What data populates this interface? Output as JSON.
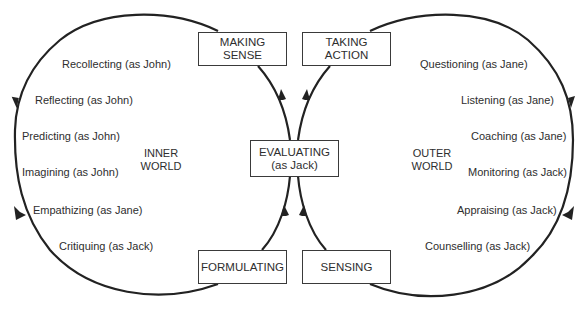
{
  "diagram": {
    "type": "figure-eight cycle",
    "boxes": {
      "making_sense": {
        "line1": "MAKING",
        "line2": "SENSE"
      },
      "taking_action": {
        "line1": "TAKING",
        "line2": "ACTION"
      },
      "evaluating": {
        "line1": "EVALUATING",
        "line2": "(as Jack)"
      },
      "formulating": {
        "line1": "FORMULATING"
      },
      "sensing": {
        "line1": "SENSING"
      }
    },
    "inner_world": {
      "line1": "INNER",
      "line2": "WORLD",
      "activities": [
        "Recollecting (as John)",
        "Reflecting (as John)",
        "Predicting (as John)",
        "Imagining (as John)",
        "Empathizing (as Jane)",
        "Critiquing (as Jack)"
      ]
    },
    "outer_world": {
      "line1": "OUTER",
      "line2": "WORLD",
      "activities": [
        "Questioning (as Jane)",
        "Listening (as Jane)",
        "Coaching (as Jane)",
        "Monitoring (as Jack)",
        "Appraising (as Jack)",
        "Counselling (as Jack)"
      ]
    },
    "colors": {
      "line": "#222222",
      "text": "#2e2e2e",
      "background": "#ffffff"
    }
  }
}
